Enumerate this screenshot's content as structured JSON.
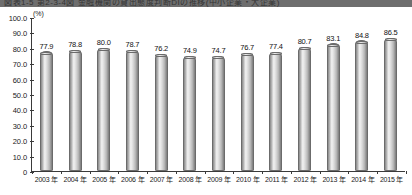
{
  "title": "図表1-5  第2-3-4図  金融機関の貸出態度判断DIの推移(中小企業・大企業)",
  "chart_data": {
    "type": "bar",
    "title": "",
    "xlabel": "",
    "ylabel": "",
    "unit_label": "(%)",
    "ylim": [
      0,
      100
    ],
    "ytick_labels": [
      "100.0",
      "90.0",
      "80.0",
      "70.0",
      "60.0",
      "50.0",
      "40.0",
      "30.0",
      "20.0",
      "10.0",
      "0"
    ],
    "ytick_values": [
      100,
      90,
      80,
      70,
      60,
      50,
      40,
      30,
      20,
      10,
      0
    ],
    "grid": false,
    "legend": "none",
    "categories": [
      "2003 年",
      "2004 年",
      "2005 年",
      "2006 年",
      "2007 年",
      "2008 年",
      "2009 年",
      "2010 年",
      "2011 年",
      "2012 年",
      "2013 年",
      "2014 年",
      "2015 年"
    ],
    "values": [
      77.9,
      78.8,
      80.0,
      78.7,
      76.2,
      74.9,
      74.7,
      76.7,
      77.4,
      80.7,
      83.1,
      84.8,
      86.5
    ],
    "value_labels": [
      "77.9",
      "78.8",
      "80.0",
      "78.7",
      "76.2",
      "74.9",
      "74.7",
      "76.7",
      "77.4",
      "80.7",
      "83.1",
      "84.8",
      "86.5"
    ],
    "bar_color": "#cfcfcf",
    "bar_edge_color": "#6b6b6b",
    "axis_color": "#3a3a3a",
    "text_color": "#1a1a1a"
  }
}
